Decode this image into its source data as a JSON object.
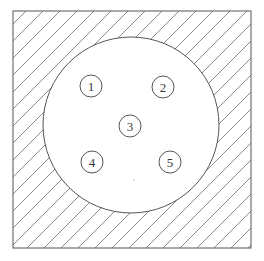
{
  "figure": {
    "background_color": "#ffffff",
    "stroke_color": "#555555",
    "hatch_color": "#8a8a8a",
    "label_color": "#3a3a3a",
    "frame": {
      "name": "outer-square-frame",
      "x": 13,
      "y": 11,
      "width": 238,
      "height": 237,
      "stroke_width": 1,
      "fill": "none"
    },
    "hatching": {
      "name": "diagonal-hatch-fill",
      "angle_degrees": 45,
      "direction": "lower-left to upper-right",
      "spacing_px": 17,
      "stroke_width": 1,
      "region": "inside square, outside circle"
    },
    "circle": {
      "name": "main-circle",
      "cx": 131,
      "cy": 125,
      "r": 88,
      "stroke_width": 1,
      "fill": "#ffffff"
    },
    "markers": [
      {
        "id": "marker-1",
        "label": "1",
        "cx": 91,
        "cy": 86,
        "r": 11
      },
      {
        "id": "marker-2",
        "label": "2",
        "cx": 163,
        "cy": 87,
        "r": 11
      },
      {
        "id": "marker-3",
        "label": "3",
        "cx": 130,
        "cy": 126,
        "r": 11
      },
      {
        "id": "marker-4",
        "label": "4",
        "cx": 92,
        "cy": 162,
        "r": 11
      },
      {
        "id": "marker-5",
        "label": "5",
        "cx": 170,
        "cy": 162,
        "r": 11
      }
    ],
    "speck": {
      "name": "faint-speck",
      "cx": 134,
      "cy": 180,
      "r": 1
    }
  }
}
